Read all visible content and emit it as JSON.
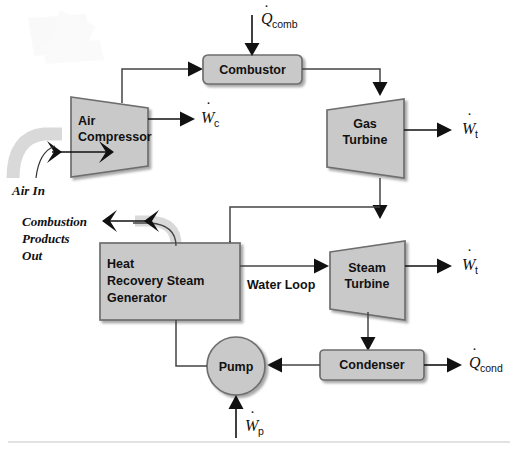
{
  "diagram": {
    "type": "process-flow-diagram",
    "colors": {
      "block_fill": "#c9c9c9",
      "block_stroke": "#6e6e6e",
      "shadow": "#b0b0b0",
      "line": "#333333",
      "arrow": "#111111",
      "pipe_gray": "#d6d6d6",
      "text": "#111111",
      "footer_rule": "#dcdcdc",
      "background": "#ffffff"
    },
    "components": [
      {
        "id": "combustor",
        "label": "Combustor",
        "shape": "rounded-rect"
      },
      {
        "id": "air-compressor",
        "label_lines": [
          "Air",
          "Compressor"
        ],
        "shape": "trapezoid-diverging"
      },
      {
        "id": "gas-turbine",
        "label_lines": [
          "Gas",
          "Turbine"
        ],
        "shape": "trapezoid-diverging"
      },
      {
        "id": "hrsg",
        "label_lines": [
          "Heat",
          "Recovery Steam",
          "Generator"
        ],
        "shape": "rect"
      },
      {
        "id": "steam-turbine",
        "label_lines": [
          "Steam",
          "Turbine"
        ],
        "shape": "trapezoid-diverging"
      },
      {
        "id": "condenser",
        "label": "Condenser",
        "shape": "rounded-rect"
      },
      {
        "id": "pump",
        "label": "Pump",
        "shape": "circle"
      }
    ],
    "stream_labels": [
      {
        "id": "air-in",
        "text_lines": [
          "Air In"
        ]
      },
      {
        "id": "combustion-products-out",
        "text_lines": [
          "Combustion",
          "Products",
          "Out"
        ]
      },
      {
        "id": "water-loop",
        "text_lines": [
          "Water Loop"
        ]
      }
    ],
    "energy_symbols": [
      {
        "id": "q-comb",
        "base": "Q",
        "sub": "comb",
        "dot": true,
        "kind": "heat-in",
        "target": "combustor"
      },
      {
        "id": "w-c",
        "base": "W",
        "sub": "c",
        "dot": true,
        "kind": "work-out",
        "target": "air-compressor"
      },
      {
        "id": "w-t-gas",
        "base": "W",
        "sub": "t",
        "dot": true,
        "kind": "work-out",
        "target": "gas-turbine"
      },
      {
        "id": "q-hrsg",
        "base": "Q",
        "sub": "",
        "dot": true,
        "kind": "heat-transfer",
        "target": "hrsg"
      },
      {
        "id": "w-t-steam",
        "base": "W",
        "sub": "t",
        "dot": true,
        "kind": "work-out",
        "target": "steam-turbine"
      },
      {
        "id": "q-cond",
        "base": "Q",
        "sub": "cond",
        "dot": true,
        "kind": "heat-out",
        "target": "condenser"
      },
      {
        "id": "w-p",
        "base": "W",
        "sub": "p",
        "dot": true,
        "kind": "work-in",
        "target": "pump"
      }
    ],
    "labels": {
      "combustor": "Combustor",
      "air_compressor_1": "Air",
      "air_compressor_2": "Compressor",
      "gas_turbine_1": "Gas",
      "gas_turbine_2": "Turbine",
      "hrsg_1": "Heat",
      "hrsg_2": "Recovery Steam",
      "hrsg_3": "Generator",
      "steam_turbine_1": "Steam",
      "steam_turbine_2": "Turbine",
      "condenser": "Condenser",
      "pump": "Pump",
      "air_in": "Air In",
      "cpo_1": "Combustion",
      "cpo_2": "Products",
      "cpo_3": "Out",
      "water_loop": "Water Loop",
      "sym_Q": "Q",
      "sym_W": "W",
      "sub_comb": "comb",
      "sub_c": "c",
      "sub_t": "t",
      "sub_cond": "cond",
      "sub_p": "p",
      "dot": "·"
    }
  }
}
